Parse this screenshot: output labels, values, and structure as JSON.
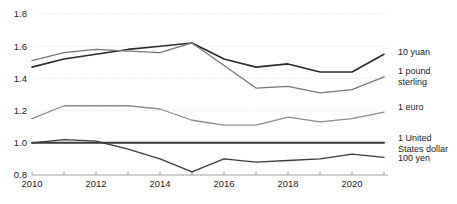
{
  "chart_data": {
    "type": "line",
    "title": "",
    "subtitle": "",
    "xlabel": "",
    "ylabel": "",
    "xlim": [
      2010,
      2021
    ],
    "ylim": [
      0.8,
      1.8
    ],
    "grid": true,
    "legend_position": "right-inline-end-of-line",
    "x": [
      2010,
      2011,
      2012,
      2013,
      2014,
      2015,
      2016,
      2017,
      2018,
      2019,
      2020,
      2021
    ],
    "y_ticks": [
      "0.8",
      "1.0",
      "1.2",
      "1.4",
      "1.6",
      "1.8"
    ],
    "y_tick_values": [
      0.8,
      1.0,
      1.2,
      1.4,
      1.6,
      1.8
    ],
    "x_ticks_all": [
      2010,
      2011,
      2012,
      2013,
      2014,
      2015,
      2016,
      2017,
      2018,
      2019,
      2020,
      2021
    ],
    "x_tick_labels": [
      "2010",
      "",
      "2012",
      "",
      "2014",
      "",
      "2016",
      "",
      "2018",
      "",
      "2020",
      ""
    ],
    "x_labeled_values": [
      2010,
      2012,
      2014,
      2016,
      2018,
      2020
    ],
    "series": [
      {
        "name": "10 yuan",
        "label_lines": [
          "10 yuan"
        ],
        "color": "#2b2b2b",
        "width": 1.6,
        "values": [
          1.47,
          1.52,
          1.55,
          1.58,
          1.6,
          1.62,
          1.52,
          1.47,
          1.49,
          1.44,
          1.44,
          1.55
        ],
        "label_y": 1.545
      },
      {
        "name": "1 pound sterling",
        "label_lines": [
          "1 pound",
          "sterling"
        ],
        "color": "#777777",
        "width": 1.3,
        "values": [
          1.51,
          1.56,
          1.58,
          1.57,
          1.56,
          1.62,
          1.48,
          1.34,
          1.35,
          1.31,
          1.33,
          1.41
        ],
        "label_y": 1.425
      },
      {
        "name": "1 euro",
        "label_lines": [
          "1 euro"
        ],
        "color": "#8a8a8a",
        "width": 1.3,
        "values": [
          1.15,
          1.23,
          1.23,
          1.23,
          1.21,
          1.14,
          1.11,
          1.11,
          1.16,
          1.13,
          1.15,
          1.19
        ],
        "label_y": 1.205
      },
      {
        "name": "1 United States dollar",
        "label_lines": [
          "1 United",
          "States dollar"
        ],
        "color": "#3a3a3a",
        "width": 2.0,
        "values": [
          1.0,
          1.0,
          1.0,
          1.0,
          1.0,
          1.0,
          1.0,
          1.0,
          1.0,
          1.0,
          1.0,
          1.0
        ],
        "label_y": 1.01
      },
      {
        "name": "100 yen",
        "label_lines": [
          "100 yen"
        ],
        "color": "#3a3a3a",
        "width": 1.3,
        "values": [
          1.0,
          1.02,
          1.01,
          0.96,
          0.9,
          0.82,
          0.9,
          0.88,
          0.89,
          0.9,
          0.93,
          0.91
        ],
        "label_y": 0.885
      }
    ]
  }
}
